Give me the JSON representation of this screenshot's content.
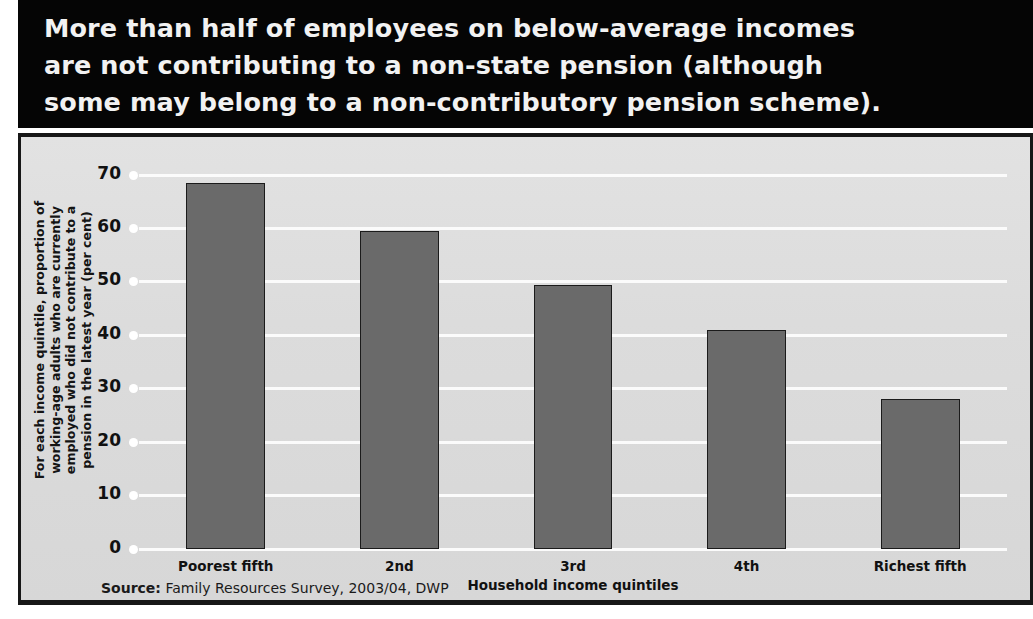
{
  "headline": {
    "text": "More than half of employees on below-average incomes\nare not contributing to a non-state pension (although\nsome may belong to a non-contributory pension scheme)."
  },
  "source": {
    "label": "Source:",
    "text": " Family Resources Survey, 2003/04, DWP"
  },
  "colors": {
    "banner_background": "#050505",
    "banner_text": "#f2f2f2",
    "panel_background": "#dcdcdc",
    "panel_border": "#171717",
    "bar_fill": "#6a6a6a",
    "bar_border": "#1b1b1b",
    "gridline": "#fbfbfb"
  },
  "chart_data": {
    "type": "bar",
    "title": "",
    "categories": [
      "Poorest fifth",
      "2nd",
      "3rd",
      "4th",
      "Richest fifth"
    ],
    "values": [
      68.5,
      59.5,
      49.5,
      41,
      28
    ],
    "xlabel": "Household income quintiles",
    "ylabel": "For each income quintile, proportion of\nworking-age adults who are currently\nemployed who did not contribute to a\npension in the latest year (per cent)",
    "ylim": [
      0,
      70
    ],
    "yticks": [
      0,
      10,
      20,
      30,
      40,
      50,
      60,
      70
    ],
    "ytick_labels": [
      "0",
      "10",
      "20",
      "30",
      "40",
      "50",
      "60",
      "70"
    ],
    "grid": true,
    "legend": false
  }
}
